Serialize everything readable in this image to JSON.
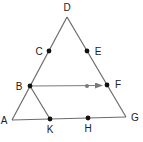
{
  "diagram": {
    "type": "geometry-triangle",
    "colors": {
      "line": "#6b6b6b",
      "point": "#111111",
      "arrow": "#7a7a7a",
      "label": "#222222"
    },
    "points": [
      {
        "id": "D",
        "label": "D",
        "x": 67,
        "y": 17,
        "lx": 67,
        "ly": 11,
        "dot": false
      },
      {
        "id": "C",
        "label": "C",
        "x": 49,
        "y": 51,
        "lx": 39,
        "ly": 55,
        "dot": true
      },
      {
        "id": "E",
        "label": "E",
        "x": 87,
        "y": 51,
        "lx": 98,
        "ly": 55,
        "dot": true
      },
      {
        "id": "B",
        "label": "B",
        "x": 30,
        "y": 86,
        "lx": 19,
        "ly": 90,
        "dot": true
      },
      {
        "id": "F",
        "label": "F",
        "x": 107,
        "y": 85,
        "lx": 118,
        "ly": 88,
        "dot": true
      },
      {
        "id": "A",
        "label": "A",
        "x": 12,
        "y": 120,
        "lx": 4,
        "ly": 124,
        "dot": false
      },
      {
        "id": "G",
        "label": "G",
        "x": 126,
        "y": 117,
        "lx": 135,
        "ly": 121,
        "dot": false
      },
      {
        "id": "K",
        "label": "K",
        "x": 50,
        "y": 119,
        "lx": 50,
        "ly": 133,
        "dot": true
      },
      {
        "id": "H",
        "label": "H",
        "x": 88,
        "y": 118,
        "lx": 88,
        "ly": 132,
        "dot": true
      }
    ],
    "segments": [
      {
        "from": "A",
        "to": "D"
      },
      {
        "from": "D",
        "to": "G"
      },
      {
        "from": "A",
        "to": "G"
      },
      {
        "from": "B",
        "to": "K"
      }
    ],
    "arrow": {
      "from": "B",
      "to": "F",
      "midpoint_dot": {
        "x": 87,
        "y": 86
      }
    }
  }
}
